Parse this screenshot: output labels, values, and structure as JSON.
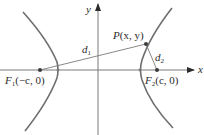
{
  "diagram": {
    "axes": {
      "x_label": "x",
      "y_label": "y"
    },
    "point_P": {
      "name": "P",
      "coords": "(x, y)"
    },
    "focus_left": {
      "name": "F",
      "subscript": "1",
      "coords": "(−c, 0)"
    },
    "focus_right": {
      "name": "F",
      "subscript": "2",
      "coords": "(c, 0)"
    },
    "distance_1": {
      "name": "d",
      "subscript": "1"
    },
    "distance_2": {
      "name": "d",
      "subscript": "2"
    },
    "colors": {
      "curve": "#6e6e6e",
      "axis": "#7a7a7a",
      "point": "#3a3a3a",
      "text": "#2b2b2b"
    }
  }
}
